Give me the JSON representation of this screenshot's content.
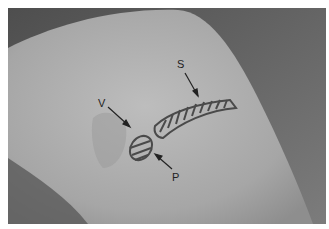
{
  "figure": {
    "labels": {
      "s": "S",
      "v": "V",
      "p": "P"
    },
    "colors": {
      "background_dark": "#5e5e5e",
      "skin": "#a8a8a8",
      "skin_light": "#b6b6b6",
      "marking": "#4a4a4a",
      "border": "#ffffff"
    }
  }
}
